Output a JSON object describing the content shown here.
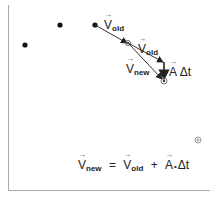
{
  "diagram": {
    "points": [
      {
        "x": 25,
        "y": 45
      },
      {
        "x": 60,
        "y": 25
      },
      {
        "x": 95,
        "y": 25
      }
    ],
    "labels": {
      "v_old_1": {
        "symbol": "V",
        "sub": "old"
      },
      "v_old_2": {
        "symbol": "V",
        "sub": "old"
      },
      "v_new": {
        "symbol": "V",
        "sub": "new"
      },
      "a_dt": {
        "symbol": "A",
        "rest": " Δt"
      }
    },
    "equation": {
      "lhs_symbol": "V",
      "lhs_sub": "new",
      "equals": "=",
      "term1_symbol": "V",
      "term1_sub": "old",
      "plus": "+",
      "term2_symbol": "A",
      "dot": "•",
      "term2_rest": "Δt"
    },
    "colors": {
      "line": "#333333",
      "point": "#111111",
      "axis": "#999999",
      "target": "#888888"
    }
  }
}
